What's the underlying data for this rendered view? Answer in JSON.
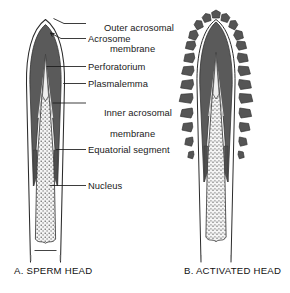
{
  "figure": {
    "panels": [
      {
        "id": "A",
        "caption": "A. SPERM HEAD",
        "caption_x": 14,
        "caption_y": 265
      },
      {
        "id": "B",
        "caption": "B. ACTIVATED HEAD",
        "caption_x": 184,
        "caption_y": 265
      }
    ],
    "labels": [
      {
        "name": "outer-acrosomal-membrane",
        "line1": "Outer acrosomal",
        "line2": "membrane",
        "x": 88,
        "y": 13
      },
      {
        "name": "acrosome",
        "line1": "Acrosome",
        "line2": "",
        "x": 88,
        "y": 37
      },
      {
        "name": "perforatorium",
        "line1": "Perforatorium",
        "line2": "",
        "x": 88,
        "y": 62
      },
      {
        "name": "plasmalemma",
        "line1": "Plasmalemma",
        "line2": "",
        "x": 88,
        "y": 79
      },
      {
        "name": "inner-acrosomal-membrane",
        "line1": "Inner acrosomal",
        "line2": "membrane",
        "x": 88,
        "y": 98
      },
      {
        "name": "equatorial-segment",
        "line1": "Equatorial segment",
        "line2": "",
        "x": 88,
        "y": 145
      },
      {
        "name": "nucleus",
        "line1": "Nucleus",
        "line2": "",
        "x": 88,
        "y": 181
      }
    ],
    "colors": {
      "background": "#ffffff",
      "acrosome_dark": "#5a5a5a",
      "acrosome_dark_edge": "#3d3d3d",
      "nucleus_fill": "#f2f2f2",
      "nucleus_stipple": "#585858",
      "outline": "#2b2b2b",
      "leader_line": "#1a1a1a",
      "text": "#1a1a1a",
      "vesicle_fill": "#555555"
    },
    "structures": [
      "plasmalemma",
      "outer acrosomal membrane",
      "acrosome",
      "inner acrosomal membrane",
      "perforatorium",
      "equatorial segment",
      "nucleus"
    ]
  }
}
